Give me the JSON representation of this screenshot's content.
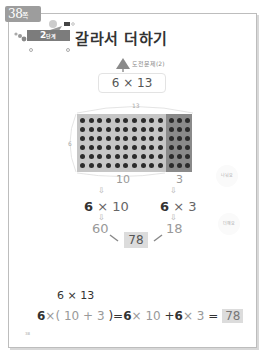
{
  "page_badge": {
    "number": "38",
    "suffix": "쪽"
  },
  "step_tag": {
    "number": "2",
    "unit": "단계"
  },
  "title": "갈라서 더하기",
  "challenge": {
    "label": "도전문제(2)",
    "problem": "6 × 13"
  },
  "array_model": {
    "rows": 6,
    "cols_total": 13,
    "cols_left": 10,
    "cols_right": 3,
    "top_label": "13",
    "side_label": "6",
    "bottom_left_label": "10",
    "bottom_right_label": "3",
    "colors": {
      "left_fill": "#c6c6c6",
      "right_fill": "#8a8a8a",
      "dot": "#2b2b2b"
    }
  },
  "breakdown": {
    "left": {
      "factor": "6",
      "op": "×",
      "value": "10",
      "product": "60"
    },
    "right": {
      "factor": "6",
      "op": "×",
      "value": "3",
      "product": "18"
    },
    "sum": "78",
    "side_note_top": "나눠요",
    "side_note_bottom": "더해요",
    "arrow": "⇩"
  },
  "equation": {
    "title": "6 × 13",
    "parts": [
      "6",
      "×(",
      "10",
      "+",
      "3",
      ")",
      "=",
      "6",
      "×",
      "10",
      "+",
      "6",
      "×",
      "3",
      "="
    ],
    "answer": "78"
  },
  "page_number": "38"
}
